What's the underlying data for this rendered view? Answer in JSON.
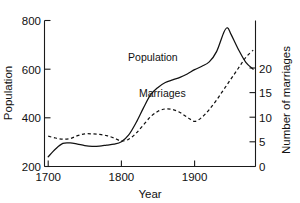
{
  "chart_data": {
    "type": "line",
    "title": "",
    "xlabel": "Year",
    "ylabel": "Population",
    "y2label": "Number of marriages",
    "xlim": [
      1690,
      1982
    ],
    "ylim": [
      200,
      800
    ],
    "y2lim": [
      0,
      24.6
    ],
    "grid": false,
    "legend_position": "inline-labels",
    "xticks": [
      1700,
      1800,
      1900
    ],
    "xtick_labels": [
      "1700",
      "1800",
      "1900"
    ],
    "yticks": [
      200,
      400,
      600,
      800
    ],
    "ytick_labels": [
      "200",
      "400",
      "600",
      "800"
    ],
    "y2ticks": [
      0,
      5,
      10,
      15,
      20
    ],
    "y2tick_labels": [
      "0",
      "5",
      "10",
      "15",
      "20"
    ],
    "series": [
      {
        "name": "Population",
        "axis": "left",
        "style": "solid",
        "color": "#111111",
        "label_text": "Population",
        "x": [
          1700,
          1710,
          1720,
          1730,
          1740,
          1750,
          1760,
          1770,
          1780,
          1790,
          1800,
          1810,
          1820,
          1830,
          1840,
          1850,
          1860,
          1870,
          1880,
          1890,
          1900,
          1910,
          1920,
          1930,
          1940,
          1945,
          1950,
          1960,
          1970,
          1980
        ],
        "values": [
          240,
          272,
          295,
          297,
          292,
          286,
          283,
          284,
          288,
          292,
          302,
          330,
          380,
          440,
          495,
          525,
          545,
          556,
          566,
          580,
          598,
          612,
          630,
          672,
          752,
          770,
          742,
          680,
          628,
          600
        ]
      },
      {
        "name": "Marriages",
        "axis": "right",
        "style": "dashed",
        "color": "#111111",
        "label_text": "Marriages",
        "x": [
          1700,
          1710,
          1720,
          1730,
          1740,
          1750,
          1760,
          1770,
          1780,
          1790,
          1800,
          1810,
          1820,
          1830,
          1840,
          1850,
          1860,
          1870,
          1880,
          1890,
          1900,
          1910,
          1920,
          1930,
          1940,
          1950,
          1960,
          1970,
          1980
        ],
        "values": [
          5.1,
          4.8,
          4.6,
          4.7,
          5.2,
          5.5,
          5.5,
          5.4,
          5.2,
          4.8,
          4.3,
          4.6,
          5.6,
          7.0,
          8.4,
          9.3,
          9.7,
          9.6,
          9.1,
          8.3,
          7.6,
          8.3,
          9.6,
          11.2,
          13.0,
          14.8,
          16.6,
          18.4,
          19.6
        ]
      }
    ],
    "annotations": [
      {
        "text": "Population",
        "x": 1843,
        "y_axis": "left",
        "y": 648
      },
      {
        "text": "Marriages",
        "x": 1856,
        "y_axis": "right",
        "y": 12.3
      }
    ]
  }
}
